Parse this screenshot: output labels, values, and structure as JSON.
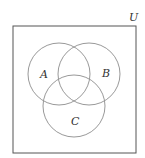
{
  "diagram": {
    "type": "venn",
    "universe_label": "U",
    "sets": [
      {
        "label": "A"
      },
      {
        "label": "B"
      },
      {
        "label": "C"
      }
    ],
    "stroke_color": "#9a9a9a",
    "box_color": "#555555"
  }
}
